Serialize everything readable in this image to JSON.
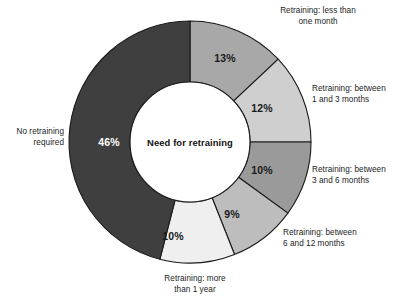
{
  "chart_data": {
    "type": "pie",
    "variant": "donut",
    "title": "Need for retraining",
    "center_label": "Need for retraining",
    "units": "percent",
    "total": 100,
    "start_angle_deg": 0,
    "direction": "clockwise",
    "categories": [
      "Retraining: less than one month",
      "Retraining: between 1 and 3 months",
      "Retraining: between 3 and 6 months",
      "Retraining: between 6 and 12 months",
      "Retraining: more than 1 year",
      "No retraining required"
    ],
    "values": [
      13,
      12,
      10,
      9,
      10,
      46
    ],
    "value_labels": [
      "13%",
      "12%",
      "10%",
      "9%",
      "10%",
      "46%"
    ],
    "colors": [
      "#a8a8a8",
      "#cfcfcf",
      "#9a9a9a",
      "#bdbdbd",
      "#efefef",
      "#3f3f3f"
    ],
    "slice_label_colors": [
      "#1a1a1a",
      "#1a1a1a",
      "#1a1a1a",
      "#1a1a1a",
      "#1a1a1a",
      "#ffffff"
    ],
    "stroke_color": "#1a1a1a",
    "legend": "callout-labels",
    "grid": false,
    "xlabel": "",
    "ylabel": ""
  },
  "geometry": {
    "center_x": 190,
    "center_y": 142,
    "outer_radius": 121,
    "inner_radius": 60
  },
  "slices": [
    {
      "label": "Retraining: less than\none month",
      "value_label": "13%",
      "color": "#a8a8a8",
      "label_x": 225,
      "label_y": 58,
      "callout_left": 243,
      "callout_top": 6,
      "callout_width": 150,
      "callout_align": "center"
    },
    {
      "label": "Retraining: between\n1 and 3 months",
      "value_label": "12%",
      "color": "#cfcfcf",
      "label_x": 262,
      "label_y": 108,
      "callout_left": 312,
      "callout_top": 84,
      "callout_width": 82,
      "callout_align": "left"
    },
    {
      "label": "Retraining: between\n3 and 6 months",
      "value_label": "10%",
      "color": "#9a9a9a",
      "label_x": 262,
      "label_y": 170,
      "callout_left": 312,
      "callout_top": 165,
      "callout_width": 82,
      "callout_align": "left"
    },
    {
      "label": "Retraining: between\n6 and 12 months",
      "value_label": "9%",
      "color": "#bdbdbd",
      "label_x": 232,
      "label_y": 214,
      "callout_left": 283,
      "callout_top": 228,
      "callout_width": 110,
      "callout_align": "left"
    },
    {
      "label": "Retraining: more\nthan 1 year",
      "value_label": "10%",
      "color": "#efefef",
      "label_x": 173,
      "label_y": 236,
      "callout_left": 140,
      "callout_top": 274,
      "callout_width": 110,
      "callout_align": "center"
    },
    {
      "label": "No retraining\nrequired",
      "value_label": "46%",
      "color": "#3f3f3f",
      "label_x": 109,
      "label_y": 142,
      "callout_left": 2,
      "callout_top": 127,
      "callout_width": 62,
      "callout_align": "right"
    }
  ]
}
